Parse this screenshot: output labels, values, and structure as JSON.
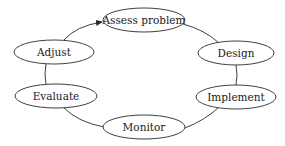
{
  "diagram": {
    "type": "cycle",
    "nodes": [
      {
        "id": "assess",
        "label": "Assess problem"
      },
      {
        "id": "design",
        "label": "Design"
      },
      {
        "id": "implement",
        "label": "Implement"
      },
      {
        "id": "monitor",
        "label": "Monitor"
      },
      {
        "id": "evaluate",
        "label": "Evaluate"
      },
      {
        "id": "adjust",
        "label": "Adjust"
      }
    ],
    "edges": [
      {
        "from": "assess",
        "to": "design"
      },
      {
        "from": "design",
        "to": "implement"
      },
      {
        "from": "implement",
        "to": "monitor"
      },
      {
        "from": "monitor",
        "to": "evaluate"
      },
      {
        "from": "evaluate",
        "to": "adjust"
      },
      {
        "from": "adjust",
        "to": "assess",
        "arrow": true
      }
    ],
    "colors": {
      "stroke": "#2a2a2a",
      "fill": "#ffffff",
      "text": "#1a1a1a"
    }
  }
}
